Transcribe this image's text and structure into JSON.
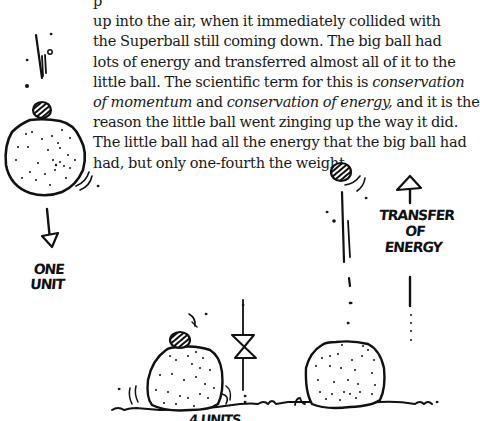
{
  "paragraph": {
    "lines": [
      {
        "parts": [
          {
            "text": "p",
            "italic": false
          }
        ]
      },
      {
        "parts": [
          {
            "text": "up into the air, when it immediately collided with",
            "italic": false
          }
        ]
      },
      {
        "parts": [
          {
            "text": "the Superball still coming down.  The big ball had",
            "italic": false
          }
        ]
      },
      {
        "parts": [
          {
            "text": "lots of energy and transferred almost all of it to the",
            "italic": false
          }
        ]
      },
      {
        "parts": [
          {
            "text": "little ball.  The scientific term for this  is ",
            "italic": false
          },
          {
            "text": "conservation",
            "italic": true
          }
        ]
      },
      {
        "parts": [
          {
            "text": "of momentum",
            "italic": true
          },
          {
            "text": " and ",
            "italic": false
          },
          {
            "text": "conservation of energy,",
            "italic": true
          },
          {
            "text": " and it is the",
            "italic": false
          }
        ]
      },
      {
        "parts": [
          {
            "text": "reason the little ball went zinging up the way it did.",
            "italic": false
          }
        ]
      },
      {
        "parts": [
          {
            "text": "The little ball had all the energy that the big ball had",
            "italic": false
          }
        ]
      },
      {
        "parts": [
          {
            "text": "had, but only one-fourth the weight.",
            "italic": false
          }
        ]
      }
    ]
  },
  "illustration": {
    "left_label": {
      "line1": "ONE",
      "line2": "UNIT"
    },
    "right_label": {
      "line1": "TRANSFER",
      "line2": "OF",
      "line3": "ENERGY"
    },
    "bottom_label_partial": "4 UNITS",
    "ink_color": "#111111",
    "paper_color": "#ffffff"
  }
}
